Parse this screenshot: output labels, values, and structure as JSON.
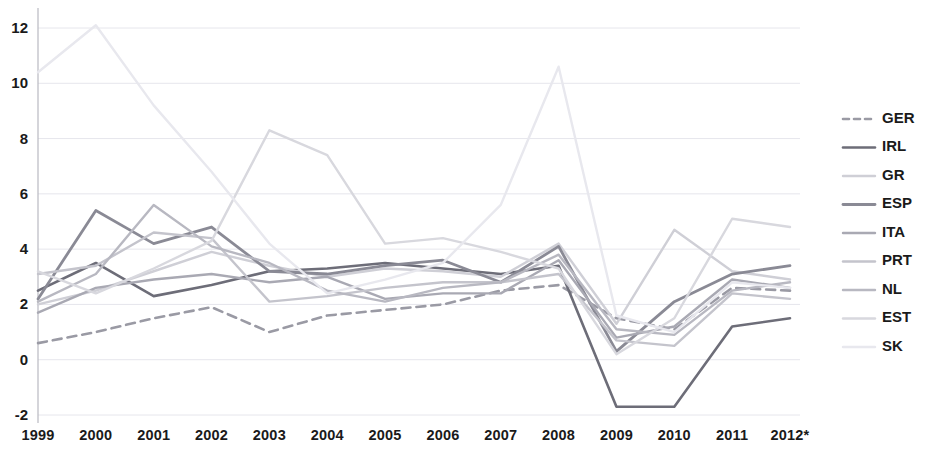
{
  "chart_data": {
    "type": "line",
    "title": "",
    "subtitle": "",
    "xlabel": "",
    "ylabel": "",
    "x": [
      "1999",
      "2000",
      "2001",
      "2002",
      "2003",
      "2004",
      "2005",
      "2006",
      "2007",
      "2008",
      "2009",
      "2010",
      "2011",
      "2012*"
    ],
    "categories": [
      "1999",
      "2000",
      "2001",
      "2002",
      "2003",
      "2004",
      "2005",
      "2006",
      "2007",
      "2008",
      "2009",
      "2010",
      "2011",
      "2012*"
    ],
    "ylim": [
      -2,
      13
    ],
    "yticks": [
      -2,
      0,
      2,
      4,
      6,
      8,
      10,
      12
    ],
    "ytick_labels": [
      "-2",
      "0",
      "2",
      "4",
      "6",
      "8",
      "10",
      "12"
    ],
    "grid": true,
    "legend_position": "right",
    "series": [
      {
        "name": "GER",
        "color": "#9a9aa4",
        "style": "dashed",
        "width": 2.6,
        "values": [
          0.6,
          1.0,
          1.5,
          1.9,
          1.0,
          1.6,
          1.8,
          2.0,
          2.5,
          2.7,
          1.5,
          1.1,
          2.6,
          2.5
        ]
      },
      {
        "name": "IRL",
        "color": "#6d6d78",
        "style": "solid",
        "width": 2.6,
        "values": [
          2.5,
          3.5,
          2.3,
          2.7,
          3.2,
          3.3,
          3.5,
          3.3,
          3.1,
          3.4,
          -1.7,
          -1.7,
          1.2,
          1.5
        ]
      },
      {
        "name": "GR",
        "color": "#cfcfd6",
        "style": "solid",
        "width": 2.4,
        "values": [
          2.0,
          2.5,
          3.2,
          3.9,
          3.4,
          3.0,
          3.3,
          3.2,
          3.0,
          4.2,
          1.3,
          4.7,
          3.2,
          2.9
        ]
      },
      {
        "name": "ESP",
        "color": "#8a8a95",
        "style": "solid",
        "width": 2.8,
        "values": [
          2.2,
          5.4,
          4.2,
          4.8,
          3.2,
          3.1,
          3.4,
          3.6,
          2.8,
          4.1,
          0.3,
          2.1,
          3.1,
          3.4
        ]
      },
      {
        "name": "ITA",
        "color": "#a9a9b3",
        "style": "solid",
        "width": 2.4,
        "values": [
          1.7,
          2.6,
          2.9,
          3.1,
          2.8,
          3.0,
          2.2,
          2.4,
          2.4,
          3.6,
          0.8,
          1.2,
          2.9,
          2.6
        ]
      },
      {
        "name": "PRT",
        "color": "#c4c4cc",
        "style": "solid",
        "width": 2.4,
        "values": [
          3.1,
          3.4,
          4.6,
          4.4,
          2.1,
          2.3,
          2.6,
          2.8,
          2.8,
          3.1,
          0.7,
          0.5,
          2.4,
          2.2
        ]
      },
      {
        "name": "NL",
        "color": "#b8b8c1",
        "style": "solid",
        "width": 2.4,
        "values": [
          2.1,
          3.1,
          5.6,
          4.1,
          3.5,
          2.5,
          2.1,
          2.6,
          2.8,
          3.8,
          1.1,
          0.9,
          2.5,
          2.8
        ]
      },
      {
        "name": "EST",
        "color": "#d8d8de",
        "style": "solid",
        "width": 2.4,
        "values": [
          3.2,
          2.4,
          3.3,
          4.3,
          8.3,
          7.4,
          4.2,
          4.4,
          3.9,
          3.3,
          0.2,
          1.5,
          5.1,
          4.8
        ]
      },
      {
        "name": "SK",
        "color": "#e8e8ee",
        "style": "solid",
        "width": 2.4,
        "values": [
          10.4,
          12.1,
          9.2,
          6.8,
          4.2,
          2.4,
          2.9,
          3.5,
          5.6,
          10.6,
          1.6,
          1.0,
          2.8,
          2.6
        ]
      }
    ]
  },
  "legend": {
    "items": [
      {
        "label": "GER"
      },
      {
        "label": "IRL"
      },
      {
        "label": "GR"
      },
      {
        "label": "ESP"
      },
      {
        "label": "ITA"
      },
      {
        "label": "PRT"
      },
      {
        "label": "NL"
      },
      {
        "label": "EST"
      },
      {
        "label": "SK"
      }
    ]
  }
}
